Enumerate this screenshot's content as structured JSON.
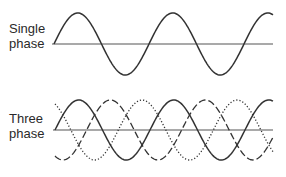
{
  "panels": [
    {
      "id": "single",
      "label_line1": "Single",
      "label_line2": "phase",
      "axis_y": 44,
      "x_start": 54,
      "x_end": 273,
      "amplitude": 31,
      "period": 95,
      "waves": [
        {
          "name": "phase-1",
          "style": "solid",
          "phase_deg": 0
        }
      ]
    },
    {
      "id": "three",
      "label_line1": "Three",
      "label_line2": "phase",
      "axis_y": 130,
      "x_start": 55,
      "x_end": 273,
      "amplitude": 30,
      "period": 95,
      "waves": [
        {
          "name": "phase-1",
          "style": "solid",
          "phase_deg": 0
        },
        {
          "name": "phase-2",
          "style": "dashed",
          "phase_deg": 120
        },
        {
          "name": "phase-3",
          "style": "dotted",
          "phase_deg": 240
        }
      ]
    }
  ],
  "colors": {
    "line": "#333333",
    "axis": "#555555",
    "text": "#2a2a2a"
  }
}
